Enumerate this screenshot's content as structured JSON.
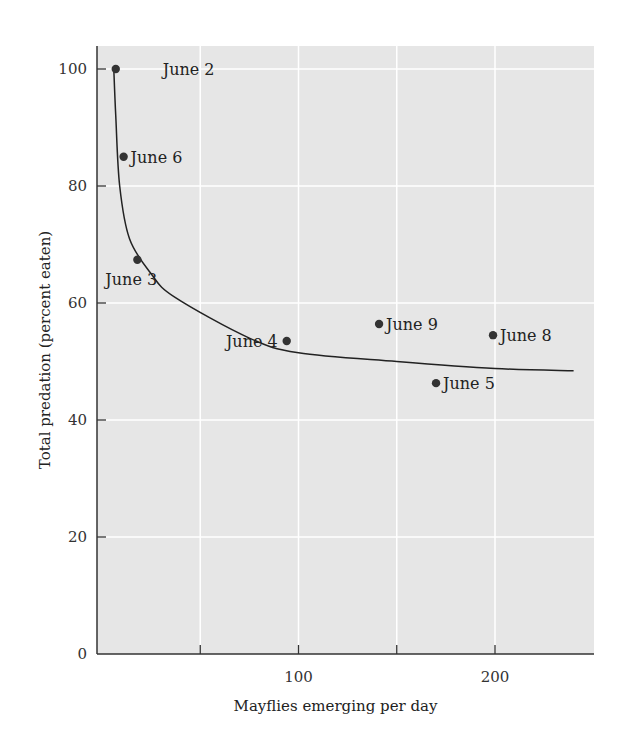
{
  "chart_data": {
    "type": "scatter",
    "title": "",
    "xlabel": "Mayflies emerging per day",
    "ylabel": "Total predation (percent eaten)",
    "xlim": [
      0,
      250
    ],
    "ylim": [
      0,
      104
    ],
    "x_ticks": [
      50,
      100,
      150,
      200
    ],
    "x_tick_labels": [
      "",
      "100",
      "",
      "200"
    ],
    "y_ticks": [
      0,
      20,
      40,
      60,
      80,
      100
    ],
    "y_tick_labels": [
      "0",
      "20",
      "40",
      "60",
      "80",
      "100"
    ],
    "grid": true,
    "points": [
      {
        "label": "June 2",
        "x": 7,
        "y": 100,
        "label_pos": "right-far"
      },
      {
        "label": "June 6",
        "x": 11,
        "y": 85,
        "label_pos": "right"
      },
      {
        "label": "June 3",
        "x": 18,
        "y": 67.4,
        "label_pos": "below-left"
      },
      {
        "label": "June 4",
        "x": 94,
        "y": 53.5,
        "label_pos": "left"
      },
      {
        "label": "June 9",
        "x": 141,
        "y": 56.4,
        "label_pos": "right"
      },
      {
        "label": "June 5",
        "x": 170,
        "y": 46.3,
        "label_pos": "right"
      },
      {
        "label": "June 8",
        "x": 199,
        "y": 54.5,
        "label_pos": "right"
      }
    ],
    "fit_curve": {
      "x": [
        6,
        7,
        9,
        14,
        25,
        37,
        75,
        100,
        150,
        200,
        240
      ],
      "y": [
        100,
        92,
        80,
        71,
        65,
        61,
        54,
        51.5,
        50,
        48.8,
        48.4
      ]
    },
    "colors": {
      "plot_bg": "#e6e6e6",
      "grid": "#ffffff",
      "axis": "#333333",
      "point": "#333333",
      "curve": "#222222"
    }
  }
}
